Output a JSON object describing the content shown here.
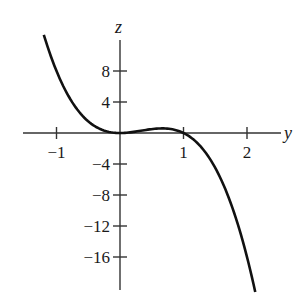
{
  "chart_data": {
    "type": "line",
    "title": "",
    "xlabel": "y",
    "ylabel": "z",
    "xlim": [
      -1.5,
      2.5
    ],
    "ylim": [
      -20.5,
      12.5
    ],
    "grid": false,
    "legend": null,
    "x_ticks": [
      -1,
      1,
      2
    ],
    "x_tick_labels": [
      "−1",
      "1",
      "2"
    ],
    "y_ticks": [
      8,
      4,
      -4,
      -8,
      -12,
      -16
    ],
    "y_tick_labels": [
      "8",
      "4",
      "−4",
      "−8",
      "−12",
      "−16"
    ],
    "series": [
      {
        "name": "z = 4y²(1 − y)",
        "x": [
          -1.2,
          -1.0,
          -0.8,
          -0.6,
          -0.4,
          -0.2,
          0.0,
          0.2,
          0.4,
          0.6,
          0.667,
          0.8,
          1.0,
          1.2,
          1.4,
          1.6,
          1.8,
          2.0,
          2.13
        ],
        "values": [
          12.67,
          8.0,
          4.61,
          2.3,
          0.9,
          0.19,
          0.0,
          0.13,
          0.38,
          0.58,
          0.59,
          0.51,
          0.0,
          -1.15,
          -3.14,
          -6.14,
          -10.37,
          -16.0,
          -20.5
        ]
      }
    ]
  },
  "axes": {
    "x_label": "y",
    "y_label": "z"
  }
}
